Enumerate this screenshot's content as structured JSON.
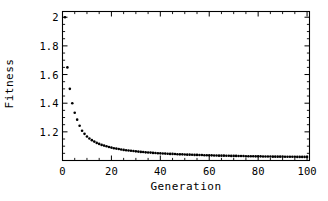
{
  "chart_data": {
    "type": "scatter",
    "title": "",
    "xlabel": "Generation",
    "ylabel": "Fitness",
    "xlim": [
      0,
      101
    ],
    "ylim": [
      1.0,
      2.04
    ],
    "grid": false,
    "legend": null,
    "xticks": [
      0,
      20,
      40,
      60,
      80,
      100
    ],
    "xtick_labels": [
      "0",
      "20",
      "40",
      "60",
      "80",
      "100"
    ],
    "x_minor_tick_step": 5,
    "yticks": [
      1.2,
      1.4,
      1.6,
      1.8,
      2.0
    ],
    "ytick_labels": [
      "1.2",
      "1.4",
      "1.6",
      "1.8",
      "2"
    ],
    "y_minor_tick_step": 0.05,
    "marker": "point",
    "marker_color": "#000000",
    "marker_size_px": 2.6,
    "frame_color": "#000000",
    "background": "#ffffff",
    "series": [
      {
        "name": "fitness",
        "x": [
          1,
          2,
          3,
          4,
          5,
          6,
          7,
          8,
          9,
          10,
          11,
          12,
          13,
          14,
          15,
          16,
          17,
          18,
          19,
          20,
          21,
          22,
          23,
          24,
          25,
          26,
          27,
          28,
          29,
          30,
          31,
          32,
          33,
          34,
          35,
          36,
          37,
          38,
          39,
          40,
          41,
          42,
          43,
          44,
          45,
          46,
          47,
          48,
          49,
          50,
          51,
          52,
          53,
          54,
          55,
          56,
          57,
          58,
          59,
          60,
          61,
          62,
          63,
          64,
          65,
          66,
          67,
          68,
          69,
          70,
          71,
          72,
          73,
          74,
          75,
          76,
          77,
          78,
          79,
          80,
          81,
          82,
          83,
          84,
          85,
          86,
          87,
          88,
          89,
          90,
          91,
          92,
          93,
          94,
          95,
          96,
          97,
          98,
          99,
          100
        ],
        "y": [
          2.0,
          1.65,
          1.5,
          1.4,
          1.333,
          1.285,
          1.243,
          1.208,
          1.186,
          1.168,
          1.154,
          1.142,
          1.132,
          1.123,
          1.116,
          1.109,
          1.104,
          1.099,
          1.094,
          1.09,
          1.086,
          1.083,
          1.08,
          1.077,
          1.074,
          1.072,
          1.07,
          1.068,
          1.066,
          1.064,
          1.062,
          1.06,
          1.059,
          1.057,
          1.056,
          1.055,
          1.053,
          1.052,
          1.051,
          1.05,
          1.049,
          1.048,
          1.047,
          1.046,
          1.046,
          1.045,
          1.044,
          1.043,
          1.043,
          1.042,
          1.041,
          1.041,
          1.04,
          1.039,
          1.039,
          1.038,
          1.038,
          1.037,
          1.037,
          1.036,
          1.036,
          1.035,
          1.035,
          1.034,
          1.034,
          1.034,
          1.033,
          1.033,
          1.032,
          1.032,
          1.032,
          1.031,
          1.031,
          1.031,
          1.03,
          1.03,
          1.03,
          1.03,
          1.029,
          1.029,
          1.029,
          1.028,
          1.028,
          1.028,
          1.028,
          1.027,
          1.027,
          1.027,
          1.027,
          1.027,
          1.026,
          1.026,
          1.026,
          1.026,
          1.026,
          1.025,
          1.025,
          1.025,
          1.025,
          1.025
        ]
      }
    ]
  }
}
